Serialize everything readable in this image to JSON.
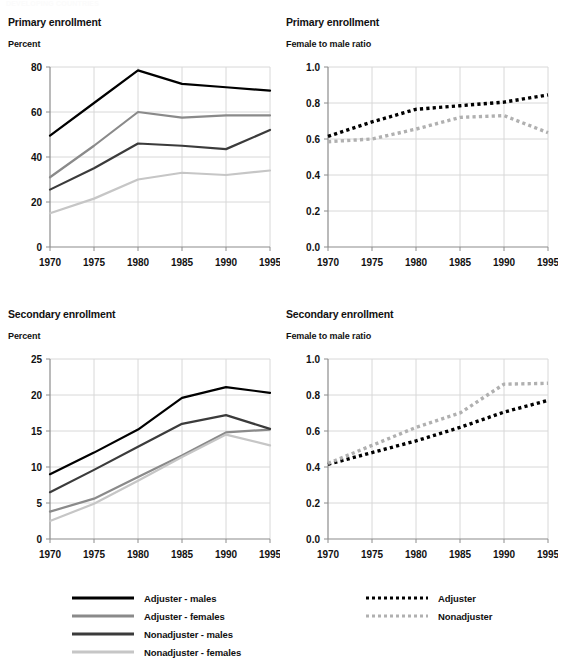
{
  "top_fragment": "DEVELOPING COUNTRIES",
  "colors": {
    "adjuster_males": "#000000",
    "adjuster_females": "#8a8a8a",
    "nonadjuster_males": "#3b3b3b",
    "nonadjuster_females": "#c6c6c6",
    "ratio_adjuster": "#000000",
    "ratio_nonadjuster": "#b0b0b0",
    "grid": "#d8d8d8",
    "axis": "#8c8c8c"
  },
  "panels": {
    "top_left": {
      "title": "Primary enrollment",
      "subtitle": "Percent"
    },
    "top_right": {
      "title": "Primary enrollment",
      "subtitle": "Female to male ratio"
    },
    "bottom_left": {
      "title": "Secondary enrollment",
      "subtitle": "Percent"
    },
    "bottom_right": {
      "title": "Secondary enrollment",
      "subtitle": "Female to male ratio"
    }
  },
  "legend_left": {
    "items": [
      {
        "label": "Adjuster - males",
        "color": "#000000",
        "style": "solid"
      },
      {
        "label": "Adjuster - females",
        "color": "#8a8a8a",
        "style": "solid"
      },
      {
        "label": "Nonadjuster - males",
        "color": "#3b3b3b",
        "style": "solid"
      },
      {
        "label": "Nonadjuster - females",
        "color": "#c6c6c6",
        "style": "solid"
      }
    ]
  },
  "legend_right": {
    "items": [
      {
        "label": "Adjuster",
        "color": "#000000",
        "style": "dotted"
      },
      {
        "label": "Nonadjuster",
        "color": "#b0b0b0",
        "style": "dotted"
      }
    ]
  },
  "chart_data": [
    {
      "id": "primary-percent",
      "type": "line",
      "title": "Primary enrollment",
      "subtitle": "Percent",
      "xlabel": "",
      "ylabel": "Percent",
      "x": [
        1970,
        1975,
        1980,
        1985,
        1990,
        1995
      ],
      "xlim": [
        1970,
        1995
      ],
      "ylim": [
        0,
        80
      ],
      "yticks": [
        0,
        20,
        40,
        60,
        80
      ],
      "xticks": [
        1970,
        1975,
        1980,
        1985,
        1990,
        1995
      ],
      "grid": true,
      "legend_position": "below-figure",
      "series": [
        {
          "name": "Adjuster - males",
          "color": "#000000",
          "style": "solid",
          "values": [
            49.5,
            64.0,
            78.5,
            72.5,
            71.0,
            69.5
          ]
        },
        {
          "name": "Adjuster - females",
          "color": "#8a8a8a",
          "style": "solid",
          "values": [
            31.0,
            45.0,
            60.0,
            57.5,
            58.5,
            58.5
          ]
        },
        {
          "name": "Nonadjuster - males",
          "color": "#3b3b3b",
          "style": "solid",
          "values": [
            25.5,
            35.0,
            46.0,
            45.0,
            43.5,
            52.0
          ]
        },
        {
          "name": "Nonadjuster - females",
          "color": "#c6c6c6",
          "style": "solid",
          "values": [
            15.0,
            21.5,
            30.0,
            33.0,
            32.0,
            34.0
          ]
        }
      ]
    },
    {
      "id": "primary-ratio",
      "type": "line",
      "title": "Primary enrollment",
      "subtitle": "Female to male ratio",
      "xlabel": "",
      "ylabel": "Female to male ratio",
      "x": [
        1970,
        1975,
        1980,
        1985,
        1990,
        1995
      ],
      "xlim": [
        1970,
        1995
      ],
      "ylim": [
        0.0,
        1.0
      ],
      "yticks": [
        0.0,
        0.2,
        0.4,
        0.6,
        0.8,
        1.0
      ],
      "ytick_labels": [
        "0.0",
        "0.2",
        "0.4",
        "0.6",
        "0.8",
        "1.0"
      ],
      "xticks": [
        1970,
        1975,
        1980,
        1985,
        1990,
        1995
      ],
      "grid": true,
      "legend_position": "below-figure",
      "series": [
        {
          "name": "Adjuster",
          "color": "#000000",
          "style": "dotted",
          "values": [
            0.615,
            0.695,
            0.765,
            0.785,
            0.805,
            0.845
          ]
        },
        {
          "name": "Nonadjuster",
          "color": "#b0b0b0",
          "style": "dotted",
          "values": [
            0.585,
            0.6,
            0.655,
            0.72,
            0.73,
            0.635
          ]
        }
      ]
    },
    {
      "id": "secondary-percent",
      "type": "line",
      "title": "Secondary enrollment",
      "subtitle": "Percent",
      "xlabel": "",
      "ylabel": "Percent",
      "x": [
        1970,
        1975,
        1980,
        1985,
        1990,
        1995
      ],
      "xlim": [
        1970,
        1995
      ],
      "ylim": [
        0,
        25
      ],
      "yticks": [
        0,
        5,
        10,
        15,
        20,
        25
      ],
      "xticks": [
        1970,
        1975,
        1980,
        1985,
        1990,
        1995
      ],
      "grid": true,
      "legend_position": "below-figure",
      "series": [
        {
          "name": "Adjuster - males",
          "color": "#000000",
          "style": "solid",
          "values": [
            9.0,
            12.0,
            15.2,
            19.6,
            21.1,
            20.3
          ]
        },
        {
          "name": "Adjuster - females",
          "color": "#8a8a8a",
          "style": "solid",
          "values": [
            3.8,
            5.6,
            8.6,
            11.6,
            14.8,
            15.2
          ]
        },
        {
          "name": "Nonadjuster - males",
          "color": "#3b3b3b",
          "style": "solid",
          "values": [
            6.5,
            9.6,
            12.8,
            16.0,
            17.2,
            15.3
          ]
        },
        {
          "name": "Nonadjuster - females",
          "color": "#c6c6c6",
          "style": "solid",
          "values": [
            2.5,
            4.9,
            8.1,
            11.4,
            14.5,
            13.0
          ]
        }
      ]
    },
    {
      "id": "secondary-ratio",
      "type": "line",
      "title": "Secondary enrollment",
      "subtitle": "Female to male ratio",
      "xlabel": "",
      "ylabel": "Female to male ratio",
      "x": [
        1970,
        1975,
        1980,
        1985,
        1990,
        1995
      ],
      "xlim": [
        1970,
        1995
      ],
      "ylim": [
        0.0,
        1.0
      ],
      "yticks": [
        0.0,
        0.2,
        0.4,
        0.6,
        0.8,
        1.0
      ],
      "ytick_labels": [
        "0.0",
        "0.2",
        "0.4",
        "0.6",
        "0.8",
        "1.0"
      ],
      "xticks": [
        1970,
        1975,
        1980,
        1985,
        1990,
        1995
      ],
      "grid": true,
      "legend_position": "below-figure",
      "series": [
        {
          "name": "Adjuster",
          "color": "#000000",
          "style": "dotted",
          "values": [
            0.415,
            0.48,
            0.545,
            0.62,
            0.705,
            0.77
          ]
        },
        {
          "name": "Nonadjuster",
          "color": "#b0b0b0",
          "style": "dotted",
          "values": [
            0.42,
            0.52,
            0.62,
            0.7,
            0.86,
            0.865
          ]
        }
      ]
    }
  ]
}
